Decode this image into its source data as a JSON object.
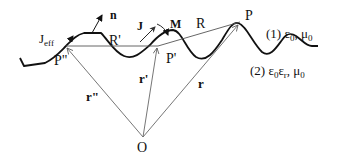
{
  "diagram": {
    "type": "geometry-schematic",
    "points": {
      "origin": {
        "label": "O",
        "x": 143,
        "y": 137
      },
      "P": {
        "label": "P",
        "x": 240,
        "y": 22
      },
      "P_prime": {
        "label": "P'",
        "x": 158,
        "y": 46
      },
      "P_double_prime": {
        "label": "P\"",
        "x": 66,
        "y": 47
      }
    },
    "vectors": {
      "r": {
        "label": "r"
      },
      "r_prime": {
        "label": "r'"
      },
      "r_double_prime": {
        "label": "r\""
      },
      "R": {
        "label": "R"
      },
      "R_prime": {
        "label": "R'"
      }
    },
    "surface_labels": {
      "normal": "n",
      "current": "J",
      "magnetization": "M",
      "effective_current": "J",
      "effective_current_sub": "eff"
    },
    "media": {
      "upper": {
        "index": "(1)",
        "eps": "ε",
        "eps_sub": "0",
        "mu": "μ",
        "mu_sub": "0"
      },
      "lower": {
        "index": "(2)",
        "eps": "ε",
        "eps_sub": "0",
        "eps2": "ε",
        "eps2_sub": "r",
        "mu": "μ",
        "mu_sub": "0"
      }
    },
    "colors": {
      "curve": "#111111",
      "vector": "#555555",
      "text": "#111111"
    }
  }
}
